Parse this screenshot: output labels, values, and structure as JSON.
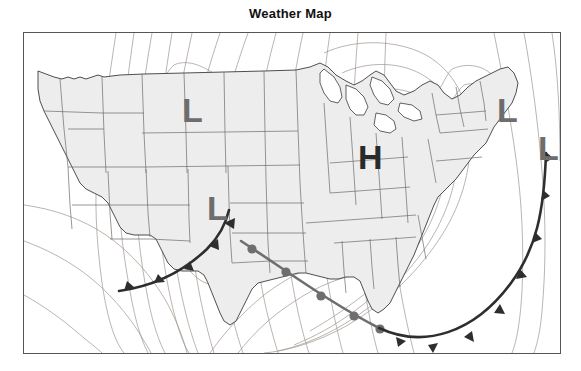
{
  "title": "Weather Map",
  "map": {
    "region": "Continental United States",
    "land_fill": "#ededed",
    "water_fill": "#ffffff",
    "border_color": "#555555",
    "state_line_color": "#6b6b6b",
    "isobar_color": "#9a8f88",
    "frame": {
      "x": 23,
      "y": 32,
      "width": 536,
      "height": 320
    }
  },
  "pressure_centers": [
    {
      "type": "L",
      "label": "L",
      "color": "#6d6d6d",
      "x": 165,
      "y": 84,
      "region": "Montana / Wyoming"
    },
    {
      "type": "L",
      "label": "L",
      "color": "#6d6d6d",
      "x": 190,
      "y": 182,
      "region": "New Mexico / Arizona"
    },
    {
      "type": "H",
      "label": "H",
      "color": "#2a2a2a",
      "x": 343,
      "y": 131,
      "region": "Illinois / Indiana"
    },
    {
      "type": "L",
      "label": "L",
      "color": "#6d6d6d",
      "x": 482,
      "y": 84,
      "region": "Vermont / New England"
    },
    {
      "type": "L",
      "label": "L",
      "color": "#6d6d6d",
      "x": 523,
      "y": 122,
      "region": "Atlantic off New England"
    }
  ],
  "fronts": [
    {
      "name": "southwest-cold-front",
      "type": "cold",
      "color": "#2e2e2e",
      "symbol": "triangles",
      "side": "right",
      "path": "M 95,258 C 130,253 160,238 183,216 C 196,203 202,190 205,177"
    },
    {
      "name": "gulf-warm-front",
      "type": "warm",
      "color": "#6e6e6e",
      "symbol": "semicircles",
      "side": "right",
      "path": "M 217,208 C 260,236 308,271 355,295"
    },
    {
      "name": "atlantic-cold-front",
      "type": "cold",
      "color": "#2e2e2e",
      "symbol": "triangles",
      "side": "left",
      "path": "M 355,295 C 400,316 450,300 487,250 C 512,216 520,180 522,120"
    }
  ],
  "legend": {
    "cold_front": "Cold front",
    "warm_front": "Warm front",
    "low_pressure": "Low pressure center",
    "high_pressure": "High pressure center",
    "isobars": "Isobars"
  }
}
